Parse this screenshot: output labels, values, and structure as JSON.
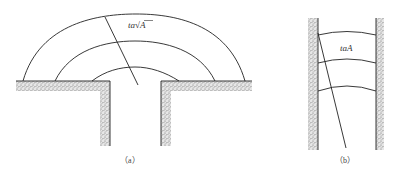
{
  "figure_a": {
    "caption": "（a）",
    "label": "ta√A",
    "label_prefix": "ta",
    "label_radical": "√",
    "label_var": "A",
    "arcs": 3,
    "description": "Semicircular wavefronts spreading from a vent in a surface"
  },
  "figure_b": {
    "caption": "（b）",
    "label": "taA",
    "arcs": 3,
    "description": "Wavefronts propagating up a channel between two walls"
  },
  "colors": {
    "line": "#222222",
    "stipple": "#8a8a8a",
    "background": "#ffffff"
  }
}
